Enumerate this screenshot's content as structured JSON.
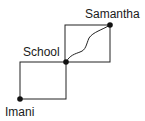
{
  "diagram": {
    "title": "",
    "nodes": [
      {
        "id": "samantha",
        "label": "Samantha"
      },
      {
        "id": "school",
        "label": "School"
      },
      {
        "id": "imani",
        "label": "Imani"
      }
    ],
    "routes": [
      {
        "from": "school",
        "to": "samantha",
        "kind": "rectangle-upper"
      },
      {
        "from": "school",
        "to": "samantha",
        "kind": "winding-path"
      },
      {
        "from": "imani",
        "to": "school",
        "kind": "rectangle-lower"
      }
    ],
    "colors": {
      "line": "#222222",
      "dot": "#111111",
      "background": "#ffffff"
    }
  }
}
